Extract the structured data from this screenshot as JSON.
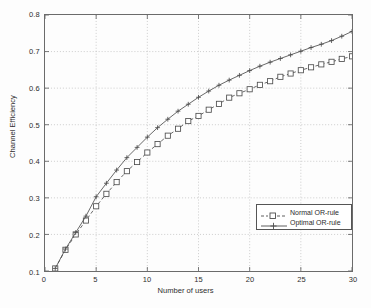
{
  "chart_data": {
    "type": "line",
    "title": "",
    "xlabel": "Number of users",
    "ylabel": "Channel Efficiency",
    "xlim": [
      0,
      30
    ],
    "ylim": [
      0.1,
      0.8
    ],
    "xticks": [
      "0",
      "5",
      "10",
      "15",
      "20",
      "25",
      "30"
    ],
    "xtick_values": [
      0,
      5,
      10,
      15,
      20,
      25,
      30
    ],
    "yticks": [
      "0.1",
      "0.2",
      "0.3",
      "0.4",
      "0.5",
      "0.6",
      "0.7",
      "0.8"
    ],
    "ytick_values": [
      0.1,
      0.2,
      0.3,
      0.4,
      0.5,
      0.6,
      0.7,
      0.8
    ],
    "grid": true,
    "grid_style": "dotted",
    "legend_position": "lower right",
    "x": [
      1,
      2,
      3,
      4,
      5,
      6,
      7,
      8,
      9,
      10,
      11,
      12,
      13,
      14,
      15,
      16,
      17,
      18,
      19,
      20,
      21,
      22,
      23,
      24,
      25,
      26,
      27,
      28,
      29,
      30
    ],
    "series": [
      {
        "name": "Normal OR-rule",
        "marker": "square",
        "linestyle": "dashed",
        "color": "#4d4d4d",
        "values": [
          0.107,
          0.158,
          0.2,
          0.238,
          0.277,
          0.311,
          0.343,
          0.373,
          0.398,
          0.424,
          0.447,
          0.47,
          0.489,
          0.51,
          0.524,
          0.541,
          0.557,
          0.574,
          0.586,
          0.597,
          0.609,
          0.619,
          0.631,
          0.64,
          0.649,
          0.657,
          0.665,
          0.672,
          0.68,
          0.687
        ]
      },
      {
        "name": "Optimal OR-rule",
        "marker": "plus",
        "linestyle": "solid",
        "color": "#4d4d4d",
        "values": [
          0.107,
          0.16,
          0.205,
          0.25,
          0.303,
          0.34,
          0.376,
          0.41,
          0.438,
          0.466,
          0.492,
          0.515,
          0.537,
          0.556,
          0.575,
          0.592,
          0.608,
          0.622,
          0.635,
          0.648,
          0.66,
          0.671,
          0.681,
          0.691,
          0.701,
          0.711,
          0.72,
          0.73,
          0.742,
          0.755
        ]
      }
    ]
  },
  "legend": {
    "entries": [
      {
        "label": "Normal OR-rule"
      },
      {
        "label": "Optimal OR-rule"
      }
    ]
  }
}
